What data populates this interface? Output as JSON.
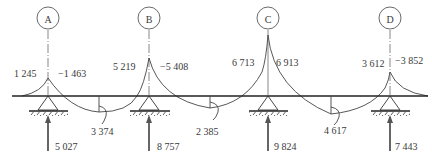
{
  "diagram": {
    "type": "continuous beam moment and reaction diagram",
    "beam": {
      "y": 96,
      "x_start": 12,
      "x_end": 428
    },
    "supports": [
      {
        "id": "A",
        "x": 48,
        "moment_left": "1 245",
        "moment_right": "−1 463",
        "reaction": "5 027"
      },
      {
        "id": "B",
        "x": 149,
        "moment_left": "5 219",
        "moment_right": "−5 408",
        "reaction": "8 757"
      },
      {
        "id": "C",
        "x": 268,
        "moment_left": "6 713",
        "moment_right": "6 913",
        "reaction": "9 824"
      },
      {
        "id": "D",
        "x": 390,
        "moment_left": "3 612",
        "moment_right": "−3 852",
        "reaction": "7 443"
      }
    ],
    "span_moments": [
      {
        "x": 99,
        "value": "3  374"
      },
      {
        "x": 210,
        "value": "2 385"
      },
      {
        "x": 331,
        "value": "4 617"
      }
    ]
  }
}
